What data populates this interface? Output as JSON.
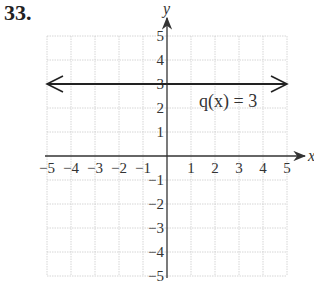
{
  "problem_number": "33.",
  "chart_data": {
    "type": "line",
    "title": "",
    "xlabel": "x",
    "ylabel": "y",
    "xlim": [
      -5,
      5
    ],
    "ylim": [
      -5,
      5
    ],
    "grid": true,
    "x_ticks": [
      "-5",
      "-4",
      "-3",
      "-2",
      "-1",
      "1",
      "2",
      "3",
      "4",
      "5"
    ],
    "y_ticks": [
      "5",
      "4",
      "3",
      "2",
      "1",
      "-1",
      "-2",
      "-3",
      "-4",
      "-5"
    ],
    "series": [
      {
        "name": "q(x) = 3",
        "x": [
          -5,
          5
        ],
        "y": [
          3,
          3
        ],
        "arrows": "both"
      }
    ],
    "annotations": [
      {
        "text": "q(x) = 3",
        "x": 2.5,
        "y": 2.3
      }
    ]
  }
}
